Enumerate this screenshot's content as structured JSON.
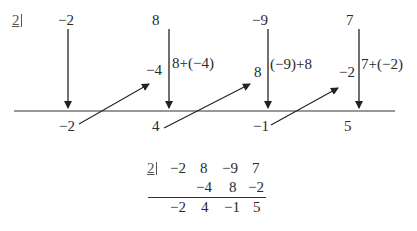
{
  "divisor": "2",
  "coefficients": [
    "−2",
    "8",
    "−9",
    "7"
  ],
  "products": [
    "−4",
    "8",
    "−2"
  ],
  "annotations": [
    "8+(−4)",
    "(−9)+8",
    "7+(−2)"
  ],
  "results": [
    "−2",
    "4",
    "−1",
    "5"
  ],
  "table": {
    "divisor": "2",
    "row1": [
      "−2",
      "8",
      "−9",
      "7"
    ],
    "row2": [
      "−4",
      "8",
      "−2"
    ],
    "row3": [
      "−2",
      "4",
      "−1",
      "5"
    ]
  }
}
